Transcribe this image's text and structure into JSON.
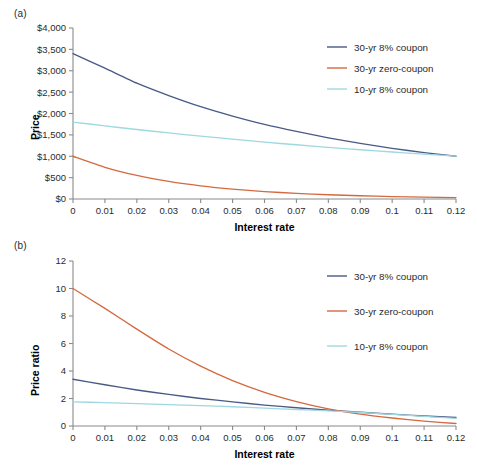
{
  "figure": {
    "panel_a_label": "(a)",
    "panel_b_label": "(b)"
  },
  "chart_data": [
    {
      "id": "panel-a",
      "type": "line",
      "title": "",
      "panel_label": "(a)",
      "xlabel": "Interest rate",
      "ylabel": "Price",
      "xlim": [
        0,
        0.12
      ],
      "ylim": [
        0,
        4000
      ],
      "grid": false,
      "legend_position": "top-right",
      "x_tick_labels": [
        "0",
        "0.01",
        "0.02",
        "0.03",
        "0.04",
        "0.05",
        "0.06",
        "0.07",
        "0.08",
        "0.09",
        "0.1",
        "0.11",
        "0.12"
      ],
      "x_tick_values": [
        0,
        0.01,
        0.02,
        0.03,
        0.04,
        0.05,
        0.06,
        0.07,
        0.08,
        0.09,
        0.1,
        0.11,
        0.12
      ],
      "y_tick_labels": [
        "$0",
        "$500",
        "$1,000",
        "$1,500",
        "$2,000",
        "$2,500",
        "$3,000",
        "$3,500",
        "$4,000"
      ],
      "y_tick_values": [
        0,
        500,
        1000,
        1500,
        2000,
        2500,
        3000,
        3500,
        4000
      ],
      "x": [
        0,
        0.01,
        0.02,
        0.03,
        0.04,
        0.05,
        0.06,
        0.07,
        0.08,
        0.09,
        0.1,
        0.11,
        0.12
      ],
      "series": [
        {
          "name": "30-yr 8% coupon",
          "color": "#4a5a86",
          "values": [
            3400,
            3060,
            2710,
            2420,
            2160,
            1940,
            1745,
            1580,
            1430,
            1300,
            1185,
            1085,
            1000
          ]
        },
        {
          "name": "30-yr zero-coupon",
          "color": "#d4693f",
          "values": [
            1000,
            742,
            552,
            412,
            308,
            231,
            174,
            131,
            99,
            75,
            57,
            44,
            33
          ]
        },
        {
          "name": "10-yr 8% coupon",
          "color": "#9fd8e0",
          "values": [
            1800,
            1710,
            1625,
            1545,
            1470,
            1400,
            1330,
            1268,
            1208,
            1152,
            1100,
            1050,
            1004
          ]
        }
      ]
    },
    {
      "id": "panel-b",
      "type": "line",
      "title": "",
      "panel_label": "(b)",
      "xlabel": "Interest rate",
      "ylabel": "Price ratio",
      "xlim": [
        0,
        0.12
      ],
      "ylim": [
        0,
        12
      ],
      "grid": false,
      "legend_position": "top-right",
      "x_tick_labels": [
        "0",
        "0.01",
        "0.02",
        "0.03",
        "0.04",
        "0.05",
        "0.06",
        "0.07",
        "0.08",
        "0.09",
        "0.1",
        "0.11",
        "0.12"
      ],
      "x_tick_values": [
        0,
        0.01,
        0.02,
        0.03,
        0.04,
        0.05,
        0.06,
        0.07,
        0.08,
        0.09,
        0.1,
        0.11,
        0.12
      ],
      "y_tick_labels": [
        "0",
        "2",
        "4",
        "6",
        "8",
        "10",
        "12"
      ],
      "y_tick_values": [
        0,
        2,
        4,
        6,
        8,
        10,
        12
      ],
      "x": [
        0,
        0.01,
        0.02,
        0.03,
        0.04,
        0.05,
        0.06,
        0.07,
        0.08,
        0.09,
        0.1,
        0.11,
        0.12
      ],
      "series": [
        {
          "name": "30-yr 8% coupon",
          "color": "#4a5a86",
          "values": [
            3.4,
            3.0,
            2.62,
            2.3,
            2.0,
            1.76,
            1.52,
            1.33,
            1.15,
            1.0,
            0.86,
            0.73,
            0.62
          ]
        },
        {
          "name": "30-yr zero-coupon",
          "color": "#d4693f",
          "values": [
            10.0,
            8.55,
            7.05,
            5.6,
            4.35,
            3.3,
            2.45,
            1.78,
            1.25,
            0.86,
            0.58,
            0.35,
            0.18
          ]
        },
        {
          "name": "10-yr 8% coupon",
          "color": "#9fd8e0",
          "values": [
            1.75,
            1.7,
            1.63,
            1.56,
            1.48,
            1.4,
            1.3,
            1.2,
            1.1,
            0.98,
            0.85,
            0.7,
            0.55
          ]
        }
      ]
    }
  ]
}
